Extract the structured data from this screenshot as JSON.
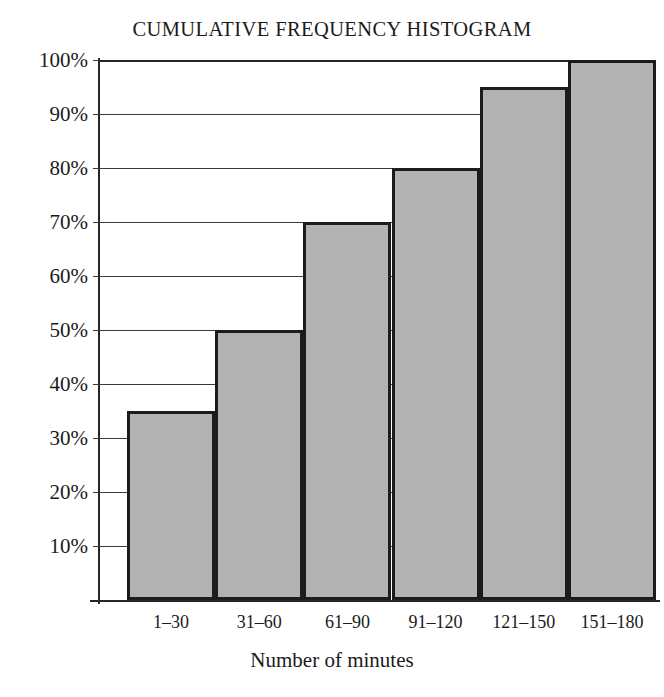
{
  "chart_data": {
    "type": "bar",
    "title": "CUMULATIVE FREQUENCY HISTOGRAM",
    "xlabel": "Number of minutes",
    "ylabel": "",
    "categories": [
      "1–30",
      "31–60",
      "61–90",
      "91–120",
      "121–150",
      "151–180"
    ],
    "values": [
      35,
      50,
      70,
      80,
      95,
      100
    ],
    "value_unit": "%",
    "ylim": [
      0,
      100
    ],
    "ytick_values": [
      10,
      20,
      30,
      40,
      50,
      60,
      70,
      80,
      90,
      100
    ],
    "ytick_labels": [
      "10%",
      "20%",
      "30%",
      "40%",
      "50%",
      "60%",
      "70%",
      "80%",
      "90%",
      "100%"
    ],
    "grid": true,
    "legend": null,
    "bar_fill_color": "#b2b2b2",
    "bar_border_color": "#1c1c1c",
    "axis_color": "#262626",
    "background_color": "#ffffff"
  }
}
